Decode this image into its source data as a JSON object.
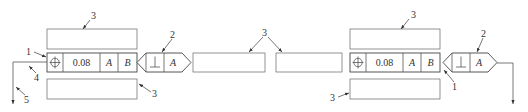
{
  "diagram": {
    "left_frame": {
      "symbol": "position-icon",
      "tolerance": "0.08",
      "datum1": "A",
      "datum2": "B"
    },
    "left_secondary_frame": {
      "symbol": "perpendicularity-icon",
      "datum": "A"
    },
    "right_frame": {
      "symbol": "position-icon",
      "tolerance": "0.08",
      "datum1": "A",
      "datum2": "B"
    },
    "right_secondary_frame": {
      "symbol": "perpendicularity-icon",
      "datum": "A"
    },
    "callouts": {
      "c1": "1",
      "c2": "2",
      "c3": "3",
      "c4": "4",
      "c5": "5"
    }
  }
}
